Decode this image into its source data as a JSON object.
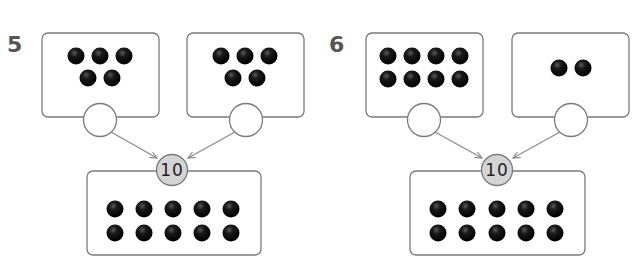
{
  "problems": [
    {
      "number": "5",
      "whole": "10",
      "parts": [
        {
          "counters": 5,
          "answer": ""
        },
        {
          "counters": 5,
          "answer": ""
        }
      ],
      "whole_counters": 10
    },
    {
      "number": "6",
      "whole": "10",
      "parts": [
        {
          "counters": 8,
          "answer": ""
        },
        {
          "counters": 2,
          "answer": ""
        }
      ],
      "whole_counters": 10
    }
  ],
  "colors": {
    "counter": "#111111",
    "box_stroke": "#7a7a7a",
    "whole_circle_fill": "#d4d4d4",
    "number_label": "#555555"
  },
  "icons": {
    "counter": "black-dot",
    "arrow": "arrow-right"
  }
}
